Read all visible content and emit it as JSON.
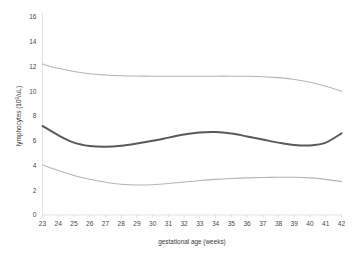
{
  "chart_data": {
    "type": "line",
    "title": "",
    "subtitle": "",
    "xlabel": "gestational age (weeks)",
    "ylabel": "lymphocytes (10⁹/uL)",
    "ylabel_base": "lymphocytes (10",
    "ylabel_exponent": "9",
    "ylabel_tail": "/uL)",
    "x": [
      23,
      24,
      25,
      26,
      27,
      28,
      29,
      30,
      31,
      32,
      33,
      34,
      35,
      36,
      37,
      38,
      39,
      40,
      41,
      42
    ],
    "xlim": [
      23,
      42
    ],
    "ylim": [
      0,
      16
    ],
    "xticks": [
      "23",
      "24",
      "25",
      "26",
      "27",
      "28",
      "29",
      "30",
      "31",
      "32",
      "33",
      "34",
      "35",
      "36",
      "37",
      "38",
      "39",
      "40",
      "41",
      "42"
    ],
    "yticks": [
      "0",
      "2",
      "4",
      "6",
      "8",
      "10",
      "12",
      "14",
      "16"
    ],
    "ytick_values": [
      0,
      2,
      4,
      6,
      8,
      10,
      12,
      14,
      16
    ],
    "grid": false,
    "legend": "none",
    "series": [
      {
        "name": "upper reference limit",
        "style": "thin-light-gray",
        "color": "#b4b4b4",
        "values": [
          12.2,
          11.85,
          11.6,
          11.42,
          11.32,
          11.26,
          11.23,
          11.22,
          11.22,
          11.22,
          11.22,
          11.22,
          11.22,
          11.21,
          11.18,
          11.1,
          10.95,
          10.72,
          10.4,
          10.0
        ]
      },
      {
        "name": "median",
        "style": "thick-dark-gray",
        "color": "#595959",
        "values": [
          7.2,
          6.45,
          5.85,
          5.58,
          5.52,
          5.6,
          5.78,
          6.0,
          6.25,
          6.5,
          6.67,
          6.7,
          6.58,
          6.35,
          6.1,
          5.85,
          5.66,
          5.62,
          5.85,
          6.6
        ]
      },
      {
        "name": "lower reference limit",
        "style": "thin-light-gray",
        "color": "#b4b4b4",
        "values": [
          4.05,
          3.6,
          3.2,
          2.88,
          2.64,
          2.48,
          2.42,
          2.45,
          2.54,
          2.66,
          2.78,
          2.88,
          2.95,
          3.0,
          3.03,
          3.05,
          3.05,
          3.0,
          2.88,
          2.7
        ]
      }
    ]
  },
  "axes": {
    "x_axis_name": "x-axis",
    "y_axis_name": "y-axis"
  }
}
